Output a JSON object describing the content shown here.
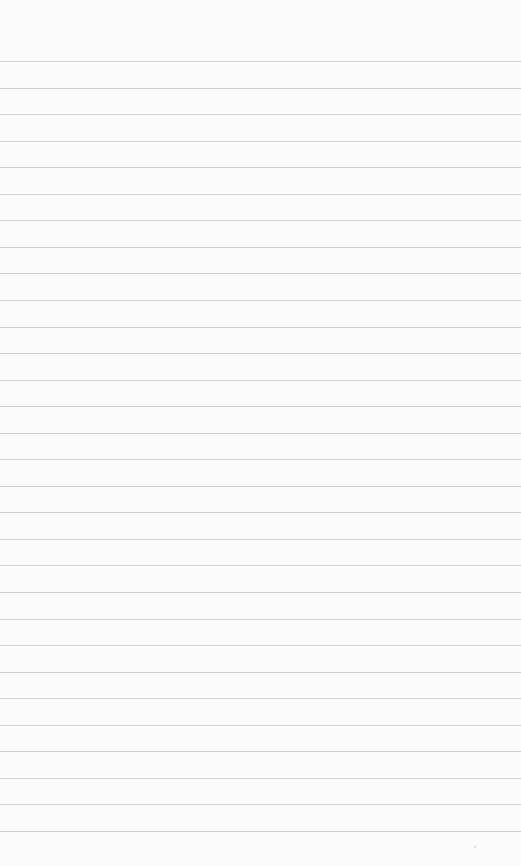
{
  "page": {
    "type": "lined-paper",
    "background_color": "#fbfbfb",
    "rule_color": "#c9c9c9",
    "rule_count": 30,
    "first_rule_y": 61,
    "rule_spacing": 26.55
  }
}
